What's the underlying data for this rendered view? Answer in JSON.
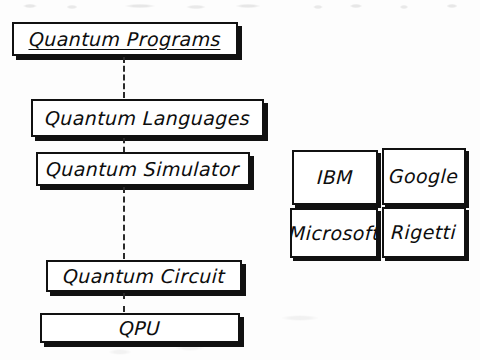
{
  "diagram": {
    "ink_color": "#111111",
    "background_color": "#fdfdfd",
    "stack": {
      "name": "quantum-stack-column",
      "boxes": [
        {
          "id": "quantum-programs",
          "label": "Quantum Programs",
          "underlined": true
        },
        {
          "id": "quantum-languages",
          "label": "Quantum Languages",
          "underlined": false
        },
        {
          "id": "quantum-simulator",
          "label": "Quantum Simulator",
          "underlined": false
        },
        {
          "id": "quantum-circuit",
          "label": "Quantum Circuit",
          "underlined": false
        },
        {
          "id": "qpu",
          "label": "QPU",
          "underlined": false
        }
      ],
      "connector_style": "dashed-vertical",
      "connector_count": 4
    },
    "vendors": {
      "name": "quantum-vendor-grid",
      "layout": "2x2-grid",
      "cells": [
        {
          "id": "vendor-ibm",
          "label": "IBM",
          "row": 1,
          "col": 1
        },
        {
          "id": "vendor-google",
          "label": "Google",
          "row": 1,
          "col": 2
        },
        {
          "id": "vendor-microsoft",
          "label": "Microsoft",
          "row": 2,
          "col": 1
        },
        {
          "id": "vendor-rigetti",
          "label": "Rigetti",
          "row": 2,
          "col": 2
        }
      ]
    }
  }
}
